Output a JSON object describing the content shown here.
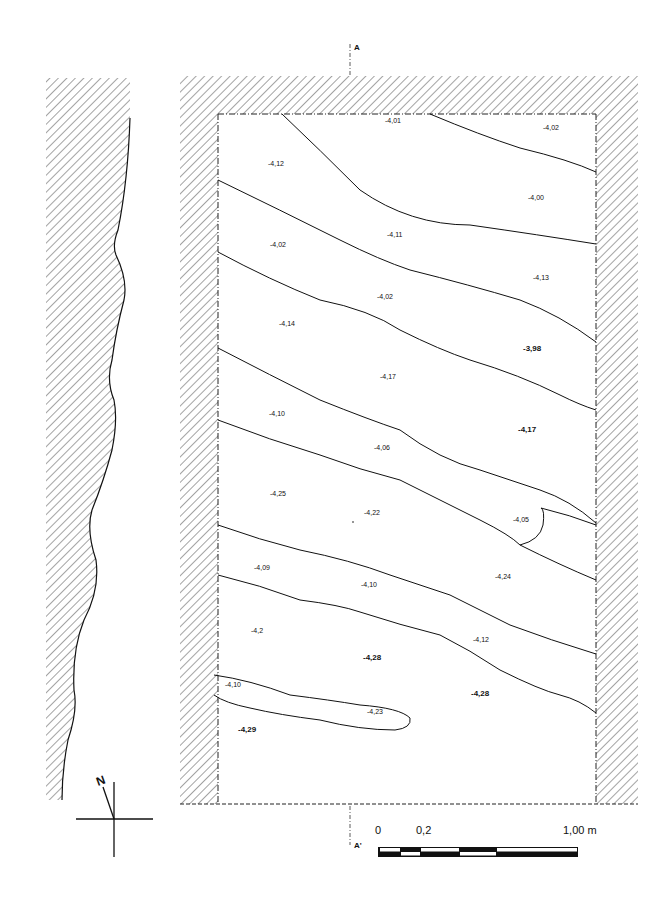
{
  "section_marker": {
    "top_label": "A",
    "bottom_label": "A'"
  },
  "north_arrow": {
    "label": "N"
  },
  "scale_bar": {
    "label_start": "0",
    "label_mid": "0,2",
    "label_end": "1,00 m"
  },
  "elevations": [
    {
      "id": "e1",
      "text": "-4,01",
      "x": 385,
      "y": 123,
      "bold": false
    },
    {
      "id": "e2",
      "text": "-4,02",
      "x": 543,
      "y": 130,
      "bold": false
    },
    {
      "id": "e3",
      "text": "-4,12",
      "x": 268,
      "y": 166,
      "bold": false
    },
    {
      "id": "e4",
      "text": "-4,00",
      "x": 528,
      "y": 200,
      "bold": false
    },
    {
      "id": "e5",
      "text": "-4,11",
      "x": 387,
      "y": 237,
      "bold": false
    },
    {
      "id": "e6",
      "text": "-4,02",
      "x": 270,
      "y": 247,
      "bold": false
    },
    {
      "id": "e7",
      "text": "-4,13",
      "x": 533,
      "y": 280,
      "bold": false
    },
    {
      "id": "e8",
      "text": "-4,02",
      "x": 377,
      "y": 299,
      "bold": false
    },
    {
      "id": "e9",
      "text": "-4,14",
      "x": 279,
      "y": 326,
      "bold": false
    },
    {
      "id": "e10",
      "text": "-3,98",
      "x": 523,
      "y": 351,
      "bold": true
    },
    {
      "id": "e11",
      "text": "-4,17",
      "x": 380,
      "y": 379,
      "bold": false
    },
    {
      "id": "e12",
      "text": "-4,10",
      "x": 269,
      "y": 416,
      "bold": false
    },
    {
      "id": "e13",
      "text": "-4,17",
      "x": 518,
      "y": 432,
      "bold": true
    },
    {
      "id": "e14",
      "text": "-4,06",
      "x": 374,
      "y": 450,
      "bold": false
    },
    {
      "id": "e15",
      "text": "-4,25",
      "x": 270,
      "y": 496,
      "bold": false
    },
    {
      "id": "e16",
      "text": "-4,22",
      "x": 364,
      "y": 515,
      "bold": false
    },
    {
      "id": "e17",
      "text": "-4,05",
      "x": 513,
      "y": 522,
      "bold": false
    },
    {
      "id": "e18",
      "text": "-4,09",
      "x": 254,
      "y": 570,
      "bold": false
    },
    {
      "id": "e19",
      "text": "-4,24",
      "x": 495,
      "y": 579,
      "bold": false
    },
    {
      "id": "e20",
      "text": "-4,10",
      "x": 361,
      "y": 587,
      "bold": false
    },
    {
      "id": "e21",
      "text": "-4,2",
      "x": 251,
      "y": 633,
      "bold": false
    },
    {
      "id": "e22",
      "text": "-4,12",
      "x": 473,
      "y": 642,
      "bold": false
    },
    {
      "id": "e23",
      "text": "-4,28",
      "x": 363,
      "y": 660,
      "bold": true
    },
    {
      "id": "e24",
      "text": "-4,10",
      "x": 225,
      "y": 687,
      "bold": false
    },
    {
      "id": "e25",
      "text": "-4,28",
      "x": 471,
      "y": 696,
      "bold": true
    },
    {
      "id": "e26",
      "text": "-4,23",
      "x": 367,
      "y": 714,
      "bold": false
    },
    {
      "id": "e27",
      "text": "-4,29",
      "x": 238,
      "y": 732,
      "bold": true
    }
  ]
}
